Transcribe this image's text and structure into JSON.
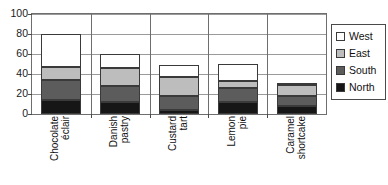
{
  "chart_data": {
    "type": "bar",
    "subtype": "stacked-column",
    "title": "",
    "xlabel": "",
    "ylabel": "",
    "ylim": [
      0,
      100
    ],
    "yticks": [
      0,
      20,
      40,
      60,
      80,
      100
    ],
    "grid": true,
    "legend_position": "right",
    "categories": [
      "Chocolate éclair",
      "Danish pastry",
      "Custard tart",
      "Lemon pie",
      "Caramel shortcake"
    ],
    "series": [
      {
        "name": "North",
        "color": "#161616",
        "values": [
          14,
          12,
          4,
          12,
          8
        ]
      },
      {
        "name": "South",
        "color": "#5c5c5c",
        "values": [
          20,
          16,
          14,
          14,
          10
        ]
      },
      {
        "name": "East",
        "color": "#bdbdbd",
        "values": [
          13,
          18,
          19,
          7,
          11
        ]
      },
      {
        "name": "West",
        "color": "#ffffff",
        "values": [
          33,
          14,
          12,
          17,
          2
        ]
      }
    ],
    "totals": [
      80,
      60,
      49,
      50,
      31
    ]
  },
  "legend": {
    "items": [
      {
        "label": "West",
        "color": "#ffffff"
      },
      {
        "label": "East",
        "color": "#bdbdbd"
      },
      {
        "label": "South",
        "color": "#5c5c5c"
      },
      {
        "label": "North",
        "color": "#161616"
      }
    ]
  },
  "axis": {
    "y_tick_labels": [
      "100",
      "80",
      "60",
      "40",
      "20",
      "0"
    ]
  }
}
